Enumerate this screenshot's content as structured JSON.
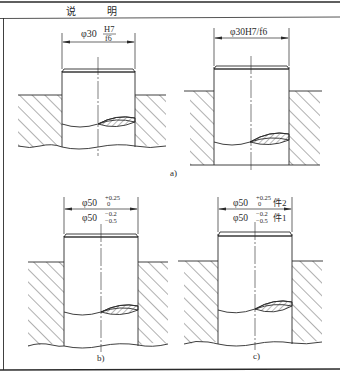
{
  "header": {
    "title_left": "说",
    "title_right": "明"
  },
  "panels": {
    "a_left": {
      "dimension_prefix": "φ30",
      "numerator": "H7",
      "denominator": "f6"
    },
    "a_right": {
      "dimension": "φ30H7/f6"
    },
    "a_label": "a)",
    "b": {
      "upper_prefix": "φ50",
      "upper_sup": "+0.25",
      "upper_sub": "0",
      "lower_prefix": "φ50",
      "lower_sup": "−0.2",
      "lower_sub": "−0.5",
      "label": "b)"
    },
    "c": {
      "upper_prefix": "φ50",
      "upper_sup": "+0.25",
      "upper_sub": "0",
      "upper_part": "件2",
      "lower_prefix": "φ50",
      "lower_sup": "−0.2",
      "lower_sub": "−0.5",
      "lower_part": "件1",
      "label": "c)"
    }
  },
  "colors": {
    "line": "#2a2a2a",
    "background": "#ffffff"
  }
}
